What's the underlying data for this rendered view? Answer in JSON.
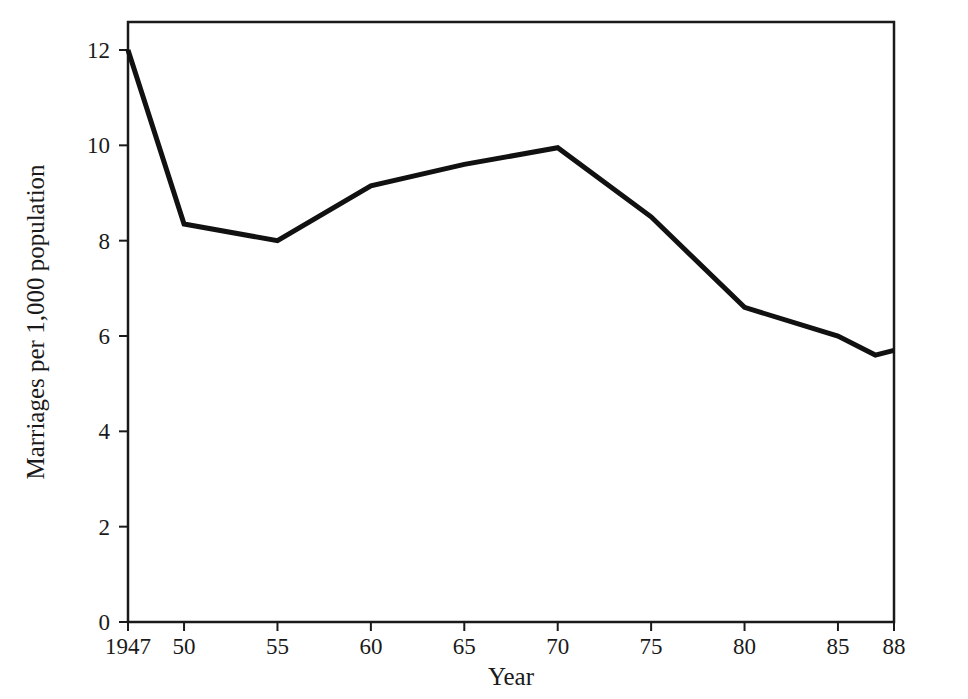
{
  "chart_data": {
    "type": "line",
    "title": "",
    "subtitle": "",
    "xlabel": "Year",
    "ylabel": "Marriages per 1,000 population",
    "x": [
      1947,
      1950,
      1955,
      1960,
      1965,
      1970,
      1975,
      1980,
      1985,
      1987,
      1988
    ],
    "values": [
      12.0,
      8.35,
      8.0,
      9.15,
      9.6,
      9.95,
      8.5,
      6.6,
      6.0,
      5.6,
      5.7
    ],
    "series": [
      {
        "name": "Marriage rate",
        "values": [
          12.0,
          8.35,
          8.0,
          9.15,
          9.6,
          9.95,
          8.5,
          6.6,
          6.0,
          5.6,
          5.7
        ]
      }
    ],
    "xtick_values": [
      1947,
      1950,
      1955,
      1960,
      1965,
      1970,
      1975,
      1980,
      1985,
      1988
    ],
    "xtick_labels": [
      "1947",
      "50",
      "55",
      "60",
      "65",
      "70",
      "75",
      "80",
      "85",
      "88"
    ],
    "ytick_values": [
      0,
      2,
      4,
      6,
      8,
      10,
      12
    ],
    "ytick_labels": [
      "0",
      "2",
      "4",
      "6",
      "8",
      "10",
      "12"
    ],
    "xlim": [
      1947,
      1988
    ],
    "ylim": [
      0,
      12.8
    ],
    "grid": false,
    "legend": "none",
    "line_color": "#111111",
    "line_width": 5,
    "axis_color": "#1a1a1a",
    "background_color": "#ffffff"
  },
  "axes": {
    "x_title": "Year",
    "y_title": "Marriages per 1,000 population"
  },
  "ticks": {
    "y": [
      {
        "label": "12",
        "value": 12
      },
      {
        "label": "10",
        "value": 10
      },
      {
        "label": "8",
        "value": 8
      },
      {
        "label": "6",
        "value": 6
      },
      {
        "label": "4",
        "value": 4
      },
      {
        "label": "2",
        "value": 2
      },
      {
        "label": "0",
        "value": 0
      }
    ],
    "x": [
      {
        "label": "1947",
        "value": 1947
      },
      {
        "label": "50",
        "value": 1950
      },
      {
        "label": "55",
        "value": 1955
      },
      {
        "label": "60",
        "value": 1960
      },
      {
        "label": "65",
        "value": 1965
      },
      {
        "label": "70",
        "value": 1970
      },
      {
        "label": "75",
        "value": 1975
      },
      {
        "label": "80",
        "value": 1980
      },
      {
        "label": "85",
        "value": 1985
      },
      {
        "label": "88",
        "value": 1988
      }
    ]
  }
}
